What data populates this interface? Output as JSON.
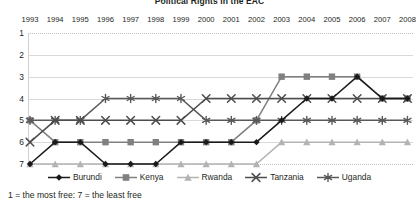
{
  "chart_data": {
    "type": "line",
    "title": "Political Rights in the EAC",
    "xlabel": "",
    "ylabel": "",
    "footnote": "1 = the most free: 7 = the least free",
    "grid": true,
    "legend_position": "bottom",
    "ylim": [
      1,
      7
    ],
    "y_inverted": true,
    "yticks": [
      "1",
      "2",
      "3",
      "4",
      "5",
      "6",
      "7"
    ],
    "categories": [
      "1993",
      "1994",
      "1995",
      "1996",
      "1997",
      "1998",
      "1999",
      "2000",
      "2001",
      "2002",
      "2003",
      "2004",
      "2005",
      "2006",
      "2007",
      "2008"
    ],
    "series": [
      {
        "name": "Burundi",
        "marker": "diamond",
        "color": "#1a1a1a",
        "values": [
          7,
          6,
          6,
          7,
          7,
          7,
          6,
          6,
          6,
          6,
          5,
          4,
          4,
          3,
          4,
          4
        ]
      },
      {
        "name": "Kenya",
        "marker": "square",
        "color": "#808080",
        "values": [
          5,
          6,
          6,
          6,
          6,
          6,
          6,
          6,
          6,
          5,
          3,
          3,
          3,
          3,
          4,
          4
        ]
      },
      {
        "name": "Rwanda",
        "marker": "triangle",
        "color": "#b3b3b3",
        "values": [
          7,
          7,
          7,
          7,
          7,
          7,
          7,
          7,
          7,
          7,
          6,
          6,
          6,
          6,
          6,
          6
        ]
      },
      {
        "name": "Tanzania",
        "marker": "x",
        "color": "#4d4d4d",
        "values": [
          6,
          5,
          5,
          5,
          5,
          5,
          5,
          4,
          4,
          4,
          4,
          4,
          4,
          4,
          4,
          4
        ]
      },
      {
        "name": "Uganda",
        "marker": "asterisk",
        "color": "#595959",
        "values": [
          5,
          5,
          5,
          4,
          4,
          4,
          4,
          5,
          5,
          5,
          5,
          5,
          5,
          5,
          5,
          5
        ]
      }
    ]
  },
  "legend": {
    "items": [
      {
        "label": "Burundi"
      },
      {
        "label": "Kenya"
      },
      {
        "label": "Rwanda"
      },
      {
        "label": "Tanzania"
      },
      {
        "label": "Uganda"
      }
    ]
  }
}
